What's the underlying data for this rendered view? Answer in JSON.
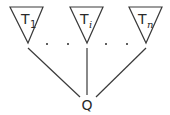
{
  "diagram": {
    "type": "tree",
    "root": {
      "label": "Q"
    },
    "subtrees": [
      {
        "base": "T",
        "subscript": "1",
        "subscript_style": "upright"
      },
      {
        "base": "T",
        "subscript": "i",
        "subscript_style": "italic"
      },
      {
        "base": "T",
        "subscript": "n",
        "subscript_style": "italic"
      }
    ],
    "ellipsis": [
      ".",
      ".",
      ".",
      "."
    ],
    "colors": {
      "stroke": "#3a3a3a",
      "text": "#2a2a2a",
      "background": "#ffffff"
    }
  }
}
